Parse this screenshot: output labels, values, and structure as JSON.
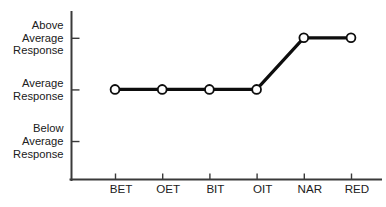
{
  "chart_data": {
    "type": "line",
    "title": "",
    "xlabel": "",
    "ylabel": "",
    "categories": [
      "BET",
      "OET",
      "BIT",
      "OIT",
      "NAR",
      "RED"
    ],
    "values": [
      "Average Response",
      "Average Response",
      "Average Response",
      "Average Response",
      "Above Average Response",
      "Above Average Response"
    ],
    "numeric_values": [
      1,
      1,
      1,
      1,
      2,
      2
    ],
    "y_tick_labels": [
      "Above Average Response",
      "Average Response",
      "Below Average Response"
    ],
    "y_tick_values": [
      2,
      1,
      0
    ],
    "y_tick_lines": [
      [
        "Above",
        "Average",
        "Response"
      ],
      [
        "Average",
        "Response"
      ],
      [
        "Below",
        "Average",
        "Response"
      ]
    ],
    "ylim": [
      -0.6,
      2.5
    ],
    "grid": false,
    "legend": false,
    "marker": "open-circle",
    "line_color": "#0d0d0d",
    "marker_fill": "#ffffff",
    "axis_color": "#3a3a3a",
    "background": "#ffffff"
  },
  "axes": {
    "y_axis_name": "response-level-axis",
    "x_axis_name": "treatment-category-axis"
  }
}
